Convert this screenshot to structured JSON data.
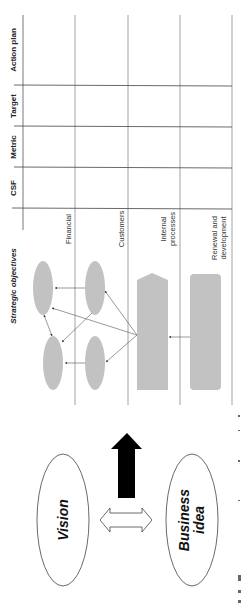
{
  "diagram": {
    "title": "Strategic objectives",
    "columns": [
      {
        "key": "csf",
        "label": "CSF"
      },
      {
        "key": "metric",
        "label": "Metric"
      },
      {
        "key": "target",
        "label": "Target"
      },
      {
        "key": "action_plan",
        "label": "Action plan"
      }
    ],
    "perspectives": [
      {
        "key": "financial",
        "label_lines": [
          "Financial"
        ]
      },
      {
        "key": "customers",
        "label_lines": [
          "Customers"
        ]
      },
      {
        "key": "internal",
        "label_lines": [
          "Internal",
          "processes"
        ]
      },
      {
        "key": "renewal",
        "label_lines": [
          "Renewal and",
          "development"
        ]
      }
    ],
    "foundation": {
      "vision": "Vision",
      "business_idea_lines": [
        "Business",
        "idea"
      ]
    },
    "colors": {
      "shape_fill": "#c2c2c2",
      "table_line": "#444444",
      "divider_line": "#9a9a9a",
      "arrow": "#555555",
      "black_arrow": "#000000"
    }
  }
}
